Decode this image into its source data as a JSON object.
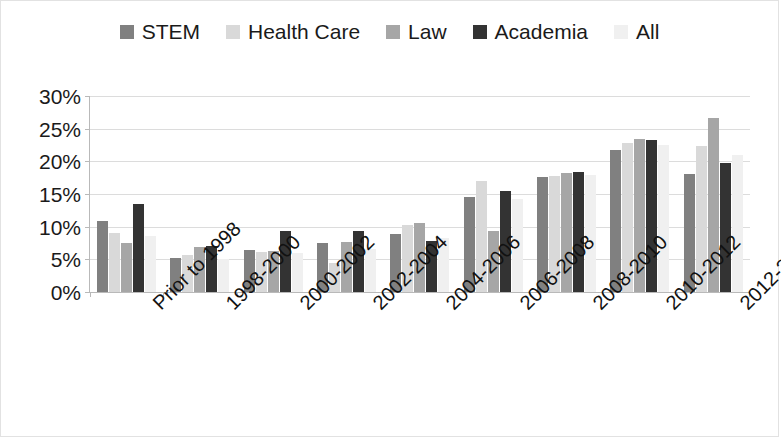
{
  "legend": {
    "items": [
      {
        "label": "STEM",
        "swatch": "#808080"
      },
      {
        "label": "Health Care",
        "swatch": "#d9d9d9"
      },
      {
        "label": "Law",
        "swatch": "#a6a6a6"
      },
      {
        "label": "Academia",
        "swatch": "#333333"
      },
      {
        "label": "All",
        "swatch": "#f0f0f0"
      }
    ]
  },
  "axis": {
    "y_ticks": [
      "0%",
      "5%",
      "10%",
      "15%",
      "20%",
      "25%",
      "30%"
    ]
  },
  "chart_data": {
    "type": "bar",
    "title": "",
    "subtitle": "",
    "xlabel": "",
    "ylabel": "",
    "ylim": [
      0,
      30
    ],
    "ytick_values": [
      0,
      5,
      10,
      15,
      20,
      25,
      30
    ],
    "ytick_labels": [
      "0%",
      "5%",
      "10%",
      "15%",
      "20%",
      "25%",
      "30%"
    ],
    "grid": true,
    "legend_position": "top",
    "value_unit": "percent",
    "categories": [
      "Prior to 1998",
      "1998-2000",
      "2000-2002",
      "2002-2004",
      "2004-2006",
      "2006-2008",
      "2008-2010",
      "2010-2012",
      "2012-2014"
    ],
    "series": [
      {
        "name": "STEM",
        "color": "#808080",
        "values": [
          10.8,
          5.2,
          6.4,
          7.5,
          8.9,
          14.5,
          17.6,
          21.7,
          18.0
        ]
      },
      {
        "name": "Health Care",
        "color": "#d9d9d9",
        "values": [
          9.0,
          5.7,
          6.1,
          4.4,
          10.2,
          17.0,
          17.8,
          22.8,
          22.3
        ]
      },
      {
        "name": "Law",
        "color": "#a6a6a6",
        "values": [
          7.5,
          6.9,
          6.3,
          7.6,
          10.6,
          9.4,
          18.2,
          23.4,
          26.7
        ]
      },
      {
        "name": "Academia",
        "color": "#333333",
        "values": [
          13.5,
          7.0,
          9.3,
          9.3,
          7.8,
          15.4,
          18.3,
          23.3,
          19.7
        ]
      },
      {
        "name": "All",
        "color": "#f0f0f0",
        "values": [
          8.6,
          5.0,
          6.0,
          6.6,
          8.3,
          14.2,
          17.9,
          22.5,
          21.0
        ]
      }
    ]
  }
}
